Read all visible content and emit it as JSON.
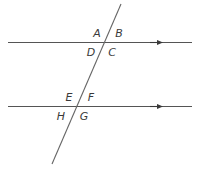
{
  "figure": {
    "background_color": "#ffffff",
    "line_color": "#555555",
    "label_color": "#3a3a3a",
    "stroke_width": 1.1,
    "canvas": {
      "width": 200,
      "height": 169
    }
  },
  "lines": {
    "parallel_top": {
      "name": "top parallel line",
      "x1": 8,
      "y1": 42.5,
      "x2": 192,
      "y2": 42.5,
      "arrow_at": {
        "x": 160,
        "y": 42.5
      },
      "direction": "right"
    },
    "parallel_bottom": {
      "name": "bottom parallel line",
      "x1": 8,
      "y1": 106.5,
      "x2": 192,
      "y2": 106.5,
      "arrow_at": {
        "x": 160,
        "y": 106.5
      },
      "direction": "right"
    },
    "transversal": {
      "name": "transversal line",
      "x1": 121,
      "y1": 4,
      "x2": 52,
      "y2": 164
    }
  },
  "intersections": {
    "upper": {
      "x": 105,
      "y": 42.5
    },
    "lower": {
      "x": 77,
      "y": 106.5
    }
  },
  "labels": [
    {
      "id": "A",
      "text": "A",
      "x": 97,
      "y": 37,
      "position": "upper-intersection-top-left"
    },
    {
      "id": "B",
      "text": "B",
      "x": 119,
      "y": 37,
      "position": "upper-intersection-top-right"
    },
    {
      "id": "D",
      "text": "D",
      "x": 91,
      "y": 56,
      "position": "upper-intersection-bottom-left"
    },
    {
      "id": "C",
      "text": "C",
      "x": 112,
      "y": 56,
      "position": "upper-intersection-bottom-right"
    },
    {
      "id": "E",
      "text": "E",
      "x": 69,
      "y": 101,
      "position": "lower-intersection-top-left"
    },
    {
      "id": "F",
      "text": "F",
      "x": 91,
      "y": 101,
      "position": "lower-intersection-top-right"
    },
    {
      "id": "H",
      "text": "H",
      "x": 61,
      "y": 120,
      "position": "lower-intersection-bottom-left"
    },
    {
      "id": "G",
      "text": "G",
      "x": 84,
      "y": 120,
      "position": "lower-intersection-bottom-right"
    }
  ]
}
